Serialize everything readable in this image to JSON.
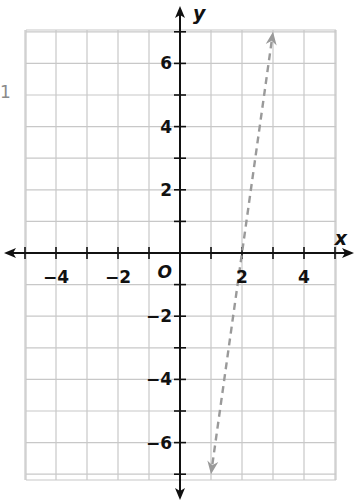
{
  "side_label": "1",
  "chart_data": {
    "type": "line",
    "title": "",
    "xlabel": "x",
    "ylabel": "y",
    "xlim": [
      -5.5,
      5.5
    ],
    "ylim": [
      -7.5,
      7.5
    ],
    "grid": true,
    "origin_label": "O",
    "x_tick_labels": [
      {
        "value": -4,
        "label": "−4"
      },
      {
        "value": -2,
        "label": "−2"
      },
      {
        "value": 2,
        "label": "2"
      },
      {
        "value": 4,
        "label": "4"
      }
    ],
    "y_tick_labels": [
      {
        "value": 6,
        "label": "6"
      },
      {
        "value": 4,
        "label": "4"
      },
      {
        "value": 2,
        "label": "2"
      },
      {
        "value": -2,
        "label": "−2"
      },
      {
        "value": -4,
        "label": "−4"
      },
      {
        "value": -6,
        "label": "−6"
      }
    ],
    "series": [
      {
        "name": "dashed line",
        "style": "dashed",
        "arrows": "both",
        "color": "#999999",
        "points": [
          [
            1,
            -7
          ],
          [
            3,
            7
          ]
        ],
        "equation": "y = 7x - 14"
      }
    ]
  },
  "colors": {
    "grid": "#c8c8c8",
    "axis": "#111111",
    "line": "#9a9a9a"
  }
}
